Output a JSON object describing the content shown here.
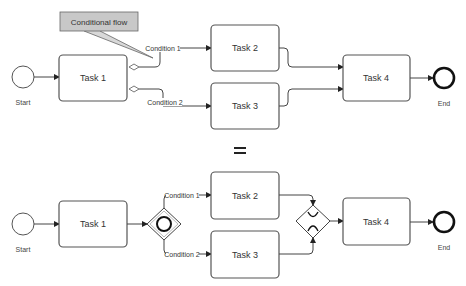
{
  "callout": {
    "label": "Conditional flow",
    "fill": "#c8c8c8"
  },
  "equals_sign": "=",
  "top_diagram": {
    "start_label": "Start",
    "end_label": "End",
    "tasks": [
      "Task 1",
      "Task 2",
      "Task 3",
      "Task 4"
    ],
    "conditions": [
      "Condition 1",
      "Condition 2"
    ]
  },
  "bottom_diagram": {
    "start_label": "Start",
    "end_label": "End",
    "tasks": [
      "Task 1",
      "Task 2",
      "Task 3",
      "Task 4"
    ],
    "conditions": [
      "Condition 1",
      "Condition 2"
    ],
    "split_gateway": "inclusive-gateway",
    "merge_gateway": "exclusive-gateway"
  }
}
